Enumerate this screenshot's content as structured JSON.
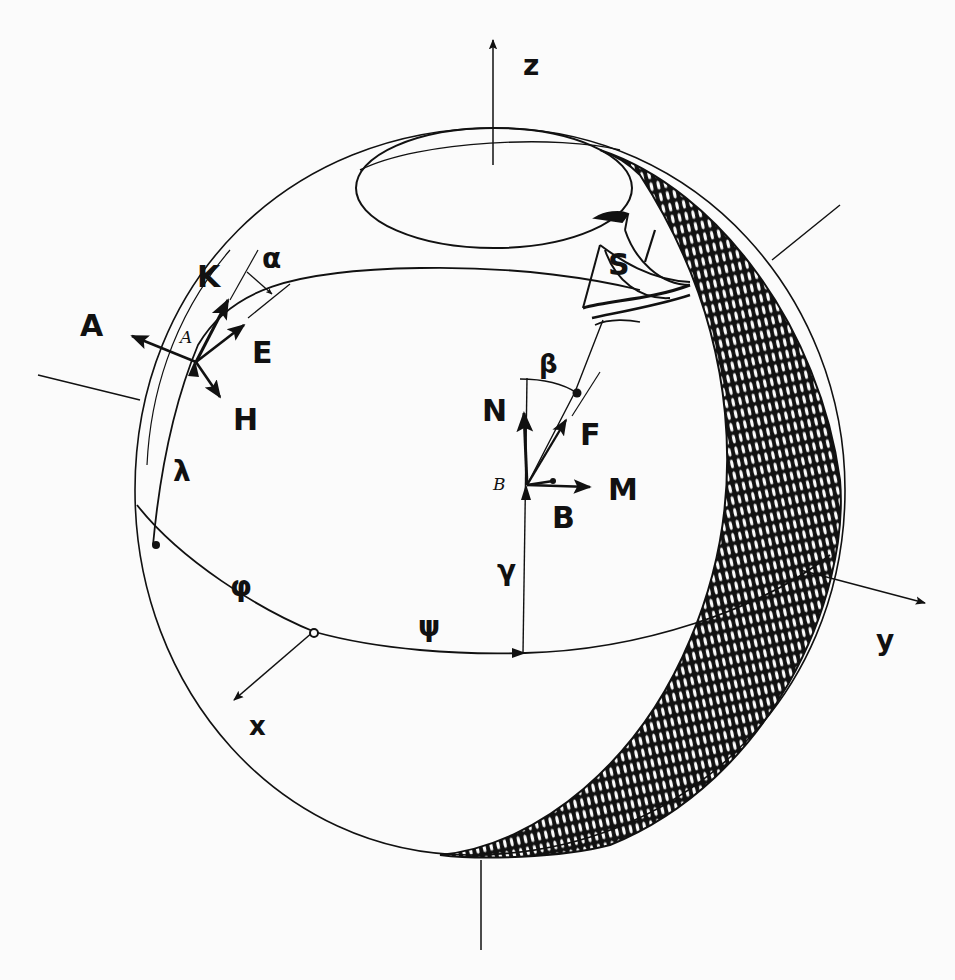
{
  "diagram": {
    "type": "spherical navigation geometry",
    "colors": {
      "ink": "#111111",
      "paper": "#fbfbfb"
    },
    "axes": [
      {
        "id": "z",
        "label": "z"
      },
      {
        "id": "y",
        "label": "y"
      },
      {
        "id": "x",
        "label": "x"
      }
    ],
    "points": [
      {
        "id": "A",
        "label": "A"
      },
      {
        "id": "B",
        "label": "B"
      },
      {
        "id": "S",
        "label": "S"
      }
    ],
    "vectors_at_A": [
      {
        "id": "K",
        "label": "K"
      },
      {
        "id": "A",
        "label": "A"
      },
      {
        "id": "E",
        "label": "E"
      },
      {
        "id": "H",
        "label": "H"
      }
    ],
    "vectors_at_B": [
      {
        "id": "N",
        "label": "N"
      },
      {
        "id": "F",
        "label": "F"
      },
      {
        "id": "M",
        "label": "M"
      },
      {
        "id": "B",
        "label": "B"
      }
    ],
    "angles": [
      {
        "id": "alpha",
        "label": "α"
      },
      {
        "id": "beta",
        "label": "β"
      },
      {
        "id": "lambda",
        "label": "λ"
      },
      {
        "id": "phi",
        "label": "φ"
      },
      {
        "id": "psi",
        "label": "ψ"
      },
      {
        "id": "gamma",
        "label": "γ"
      }
    ],
    "point_labels_italic": {
      "A": "A",
      "B": "B"
    }
  }
}
